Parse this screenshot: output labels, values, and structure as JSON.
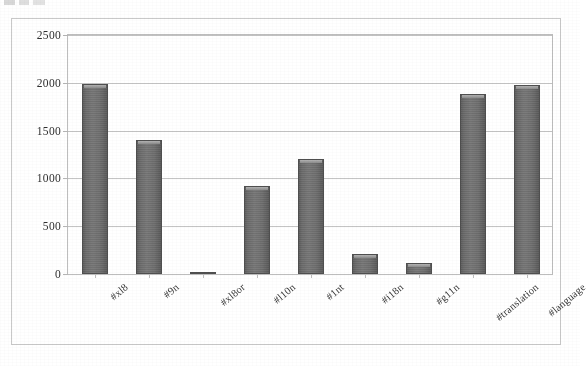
{
  "chart_data": {
    "type": "bar",
    "title": "",
    "xlabel": "",
    "ylabel": "",
    "ylim": [
      0,
      2500
    ],
    "yticks": [
      0,
      500,
      1000,
      1500,
      2000,
      2500
    ],
    "grid": true,
    "legend": false,
    "orientation": "vertical",
    "bar_color": "#6e6e6e",
    "xtick_rotation": -40,
    "categories": [
      "#xl8",
      "#9n",
      "#xl8or",
      "#l10n",
      "#1nt",
      "#i18n",
      "#g11n",
      "#translation",
      "#language"
    ],
    "values": [
      1990,
      1400,
      10,
      920,
      1200,
      210,
      115,
      1880,
      1980
    ]
  },
  "axes": {
    "y_tick_labels": [
      "2500",
      "2000",
      "1500",
      "1000",
      "500",
      "0"
    ],
    "x_tick_labels": [
      "#xl8",
      "#9n",
      "#xl8or",
      "#l10n",
      "#1nt",
      "#i18n",
      "#g11n",
      "#translation",
      "#language"
    ]
  },
  "style": {
    "frame_color": "#c9c9c9",
    "gridline_color": "#c4c4c4",
    "plot_border_color": "#bdbdbd",
    "text_color": "#2e2e2e",
    "background": "#ffffff"
  }
}
